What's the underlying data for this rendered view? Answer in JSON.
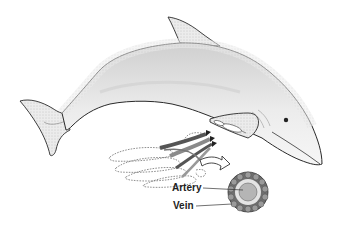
{
  "diagram": {
    "inset": "countercurrent heat exchanger in flipper",
    "labels": {
      "artery": "Artery",
      "vein": "Vein"
    },
    "colors": {
      "outline": "#2a2a2a",
      "body_shade": "#e6e6e6",
      "body_dark": "#b8b8b8",
      "vessel_dark": "#555555",
      "artery_fill": "#b5b5b5",
      "vein_ring": "#6e6e6e",
      "background": "#ffffff"
    }
  }
}
